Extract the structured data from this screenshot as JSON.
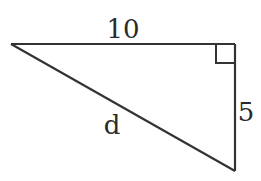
{
  "diagram": {
    "type": "right-triangle",
    "vertices": {
      "left": [
        11,
        44
      ],
      "right_angle": [
        235,
        44
      ],
      "bottom": [
        235,
        171
      ]
    },
    "right_angle_marker_size": 19,
    "stroke_color": "#333333",
    "labels": {
      "top_side": "10",
      "right_side": "5",
      "hypotenuse": "d"
    }
  }
}
